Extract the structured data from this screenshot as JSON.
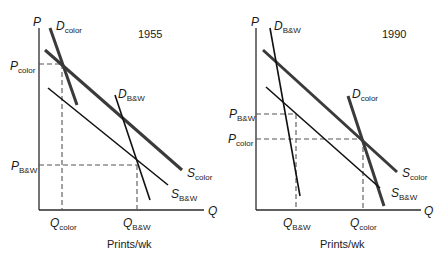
{
  "figure": {
    "x_axis_title": "Prints/wk",
    "panels": [
      {
        "year": "1955",
        "axis_p": "P",
        "axis_q": "Q",
        "curves": {
          "d_color": {
            "main": "D",
            "sub": "color"
          },
          "d_bw": {
            "main": "D",
            "sub": "B&W"
          },
          "s_color": {
            "main": "S",
            "sub": "color"
          },
          "s_bw": {
            "main": "S",
            "sub": "B&W"
          }
        },
        "price_labels": [
          {
            "main": "P",
            "sub": "color"
          },
          {
            "main": "P",
            "sub": "B&W"
          }
        ],
        "quantity_labels": [
          {
            "main": "Q",
            "sub": "color"
          },
          {
            "main": "Q",
            "sub": "B&W"
          }
        ]
      },
      {
        "year": "1990",
        "axis_p": "P",
        "axis_q": "Q",
        "curves": {
          "d_color": {
            "main": "D",
            "sub": "color"
          },
          "d_bw": {
            "main": "D",
            "sub": "B&W"
          },
          "s_color": {
            "main": "S",
            "sub": "color"
          },
          "s_bw": {
            "main": "S",
            "sub": "B&W"
          }
        },
        "price_labels": [
          {
            "main": "P",
            "sub": "B&W"
          },
          {
            "main": "P",
            "sub": "color"
          }
        ],
        "quantity_labels": [
          {
            "main": "Q",
            "sub": "B&W"
          },
          {
            "main": "Q",
            "sub": "color"
          }
        ]
      }
    ]
  },
  "colors": {
    "axis": "#2a2a2a",
    "thick_line": "#3a3a3a",
    "thin_line": "#111111",
    "dashed": "#555555"
  }
}
